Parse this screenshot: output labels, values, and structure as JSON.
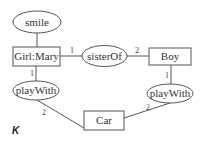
{
  "diagram": {
    "type": "graph",
    "nodes": {
      "smile": {
        "label": "smile",
        "shape": "ellipse"
      },
      "girl_mary": {
        "label": "Girl:Mary",
        "shape": "rect"
      },
      "sister_of": {
        "label": "sisterOf",
        "shape": "ellipse"
      },
      "boy": {
        "label": "Boy",
        "shape": "rect"
      },
      "play_with_left": {
        "label": "playWith",
        "shape": "ellipse"
      },
      "play_with_right": {
        "label": "playWith",
        "shape": "ellipse"
      },
      "car": {
        "label": "Car",
        "shape": "rect"
      }
    },
    "edges": [
      {
        "from": "smile",
        "to": "girl_mary",
        "label": ""
      },
      {
        "from": "girl_mary",
        "to": "sister_of",
        "label": "1"
      },
      {
        "from": "sister_of",
        "to": "boy",
        "label": "2"
      },
      {
        "from": "girl_mary",
        "to": "play_with_left",
        "label": "1"
      },
      {
        "from": "play_with_left",
        "to": "car",
        "label": "2"
      },
      {
        "from": "boy",
        "to": "play_with_right",
        "label": "1"
      },
      {
        "from": "play_with_right",
        "to": "car",
        "label": "2"
      }
    ],
    "cardinality": {
      "girl_sister": "1",
      "sister_boy": "2",
      "girl_play": "1",
      "play_car_left": "2",
      "boy_play": "1",
      "play_car_right": "2"
    },
    "panel_label": "K"
  },
  "colors": {
    "stroke": "#555555",
    "text": "#333333",
    "background": "#ffffff"
  }
}
